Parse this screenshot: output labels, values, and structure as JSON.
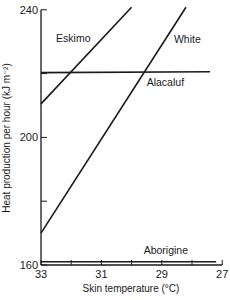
{
  "chart_data": {
    "type": "line",
    "title": "",
    "xlabel": "Skin temperature (°C)",
    "ylabel": "Heat production per hour (kJ m⁻²)",
    "xlim": [
      33,
      27
    ],
    "ylim": [
      160,
      240
    ],
    "x_reversed": true,
    "x_ticks": [
      33,
      31,
      29,
      27
    ],
    "x_minor_ticks": [
      32,
      30,
      28
    ],
    "y_ticks": [
      160,
      200,
      240
    ],
    "y_minor_ticks": [
      180,
      220
    ],
    "grid": false,
    "legend": "inline labels",
    "series": [
      {
        "name": "Eskimo",
        "x": [
          33,
          30.0
        ],
        "y": [
          210.5,
          240.8
        ],
        "label_pos": [
          32.5,
          230
        ]
      },
      {
        "name": "White",
        "x": [
          33,
          28.2
        ],
        "y": [
          170,
          240.8
        ],
        "label_pos": [
          28.6,
          229.5
        ]
      },
      {
        "name": "Alacaluf",
        "x": [
          33,
          27.4
        ],
        "y": [
          220.3,
          220.6
        ],
        "label_pos": [
          29.5,
          216
        ]
      },
      {
        "name": "Aborigine",
        "x": [
          33,
          27.2
        ],
        "y": [
          161,
          161
        ],
        "label_pos": [
          29.6,
          163.5
        ]
      }
    ]
  },
  "axes": {
    "xlabel": "Skin temperature (°C)",
    "ylabel": "Heat production per hour (kJ m⁻²)"
  }
}
